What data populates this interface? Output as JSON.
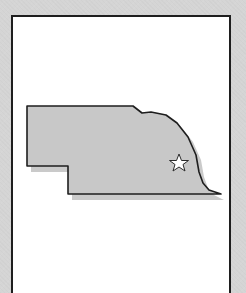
{
  "map": {
    "region": "Nebraska",
    "marker": {
      "icon": "star-icon",
      "meaning": "capital"
    },
    "colors": {
      "background": "#d5d5d5",
      "frame_fill": "#ffffff",
      "frame_border": "#1e1e1e",
      "state_fill": "#c8c8c8",
      "state_outline": "#1e1e1e",
      "shadow": "#b4b4b4",
      "star_fill": "#ffffff"
    }
  }
}
